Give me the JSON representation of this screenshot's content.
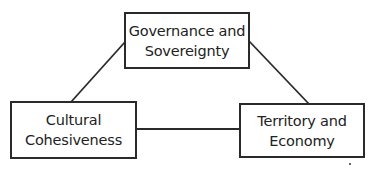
{
  "diagram": {
    "type": "triangle-relationship",
    "nodes": [
      {
        "id": "governance",
        "lines": [
          "Governance and",
          "Sovereignty"
        ]
      },
      {
        "id": "culture",
        "lines": [
          "Cultural",
          "Cohesiveness"
        ]
      },
      {
        "id": "territory",
        "lines": [
          "Territory and",
          "Economy"
        ]
      }
    ],
    "edges": [
      {
        "from": "governance",
        "to": "culture"
      },
      {
        "from": "governance",
        "to": "territory"
      },
      {
        "from": "culture",
        "to": "territory"
      }
    ],
    "colors": {
      "line": "#2a2a2a",
      "background": "#ffffff",
      "text": "#222222"
    }
  }
}
